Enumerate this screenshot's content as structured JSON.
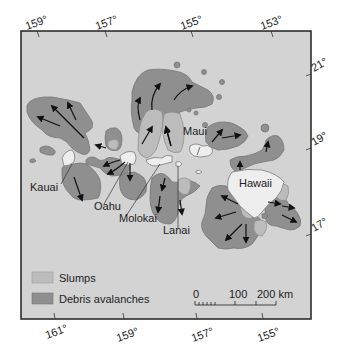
{
  "map": {
    "title": "Submarine landslides around the Hawaiian Islands",
    "colors": {
      "ocean": "#d2d2d2",
      "land": "#ececec",
      "slumps": "#b9b9b9",
      "debris_avalanches": "#8e8e8e",
      "outline": "#6e6e6e",
      "frame": "#222222",
      "arrow": "#111111"
    },
    "top_longitudes": [
      "159°",
      "157°",
      "155°",
      "153°"
    ],
    "bottom_longitudes": [
      "161°",
      "159°",
      "157°",
      "155°"
    ],
    "right_latitudes": [
      "21°",
      "19°",
      "17°"
    ],
    "islands": {
      "kauai": "Kauai",
      "oahu": "Oahu",
      "molokai": "Molokai",
      "lanai": "Lanai",
      "maui": "Maui",
      "hawaii": "Hawaii"
    },
    "legend": {
      "slumps": "Slumps",
      "debris_avalanches": "Debris avalanches"
    },
    "scale_bar": {
      "label_0": "0",
      "label_100": "100",
      "label_200": "200 km"
    }
  }
}
